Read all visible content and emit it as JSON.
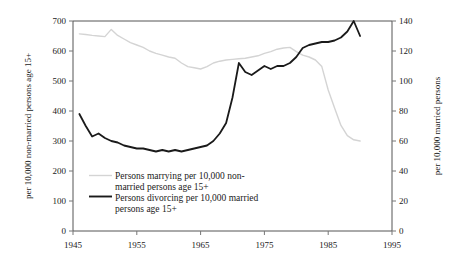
{
  "chart_data": {
    "type": "line",
    "title": "",
    "xlabel": "",
    "ylabel": "per 10,000 non-married persons age 15+",
    "y2label": "per 10,000 married persons",
    "xlim": [
      1945,
      1995
    ],
    "ylim": [
      0,
      700
    ],
    "y2lim": [
      0,
      140
    ],
    "xticks": [
      "1945",
      "1955",
      "1965",
      "1975",
      "1985",
      "1995"
    ],
    "xtick_values": [
      1945,
      1955,
      1965,
      1975,
      1985,
      1995
    ],
    "yticks": [
      "0",
      "100",
      "200",
      "300",
      "400",
      "500",
      "600",
      "700"
    ],
    "ytick_values": [
      0,
      100,
      200,
      300,
      400,
      500,
      600,
      700
    ],
    "y2ticks": [
      "0",
      "20",
      "40",
      "60",
      "80",
      "100",
      "120",
      "140"
    ],
    "y2tick_values": [
      0,
      20,
      40,
      60,
      80,
      100,
      120,
      140
    ],
    "grid": false,
    "legend_position": "inside-lower-left",
    "series": [
      {
        "name": "Persons marrying per 10,000 non-married persons age 15+",
        "axis": "left",
        "color": "#d4d4d4",
        "width": 1.4,
        "x": [
          1946,
          1947,
          1948,
          1949,
          1950,
          1951,
          1952,
          1953,
          1954,
          1955,
          1956,
          1957,
          1958,
          1959,
          1960,
          1961,
          1962,
          1963,
          1964,
          1965,
          1966,
          1967,
          1968,
          1969,
          1970,
          1971,
          1972,
          1973,
          1974,
          1975,
          1976,
          1977,
          1978,
          1979,
          1980,
          1981,
          1982,
          1983,
          1984,
          1985,
          1986,
          1987,
          1988,
          1989,
          1990
        ],
        "values": [
          657,
          655,
          652,
          650,
          648,
          672,
          652,
          640,
          628,
          620,
          612,
          600,
          592,
          586,
          580,
          576,
          560,
          548,
          544,
          540,
          548,
          560,
          566,
          570,
          572,
          574,
          576,
          580,
          584,
          592,
          598,
          606,
          610,
          612,
          598,
          586,
          580,
          570,
          548,
          470,
          410,
          352,
          318,
          304,
          300
        ]
      },
      {
        "name": "Persons divorcing per 10,000 married persons",
        "axis": "right",
        "color": "#1a1a1a",
        "width": 1.8,
        "x": [
          1946,
          1947,
          1948,
          1949,
          1950,
          1951,
          1952,
          1953,
          1954,
          1955,
          1956,
          1957,
          1958,
          1959,
          1960,
          1961,
          1962,
          1963,
          1964,
          1965,
          1966,
          1967,
          1968,
          1969,
          1970,
          1971,
          1972,
          1973,
          1974,
          1975,
          1976,
          1977,
          1978,
          1979,
          1980,
          1981,
          1982,
          1983,
          1984,
          1985,
          1986,
          1987,
          1988,
          1989,
          1990
        ],
        "values": [
          78,
          70,
          63,
          65,
          62,
          60,
          59,
          57,
          56,
          55,
          55,
          54,
          53,
          54,
          53,
          54,
          53,
          54,
          55,
          56,
          57,
          60,
          65,
          72,
          89,
          112,
          106,
          104,
          107,
          110,
          108,
          110,
          110,
          112,
          116,
          122,
          124,
          125,
          126,
          126,
          127,
          129,
          133,
          140,
          130
        ]
      }
    ],
    "legend": [
      "Persons marrying per 10,000 non-married persons age 15+",
      "Persons divorcing per 10,000 married persons age 15+"
    ],
    "legend_lines": [
      "Persons marrying per 10,000 non-",
      "married persons age 15+",
      "Persons divorcing per 10,000 married",
      "persons age 15+"
    ],
    "colors": {
      "marrying": "#d4d4d4",
      "divorcing": "#1a1a1a",
      "axis": "#555555",
      "background": "#ffffff"
    }
  }
}
